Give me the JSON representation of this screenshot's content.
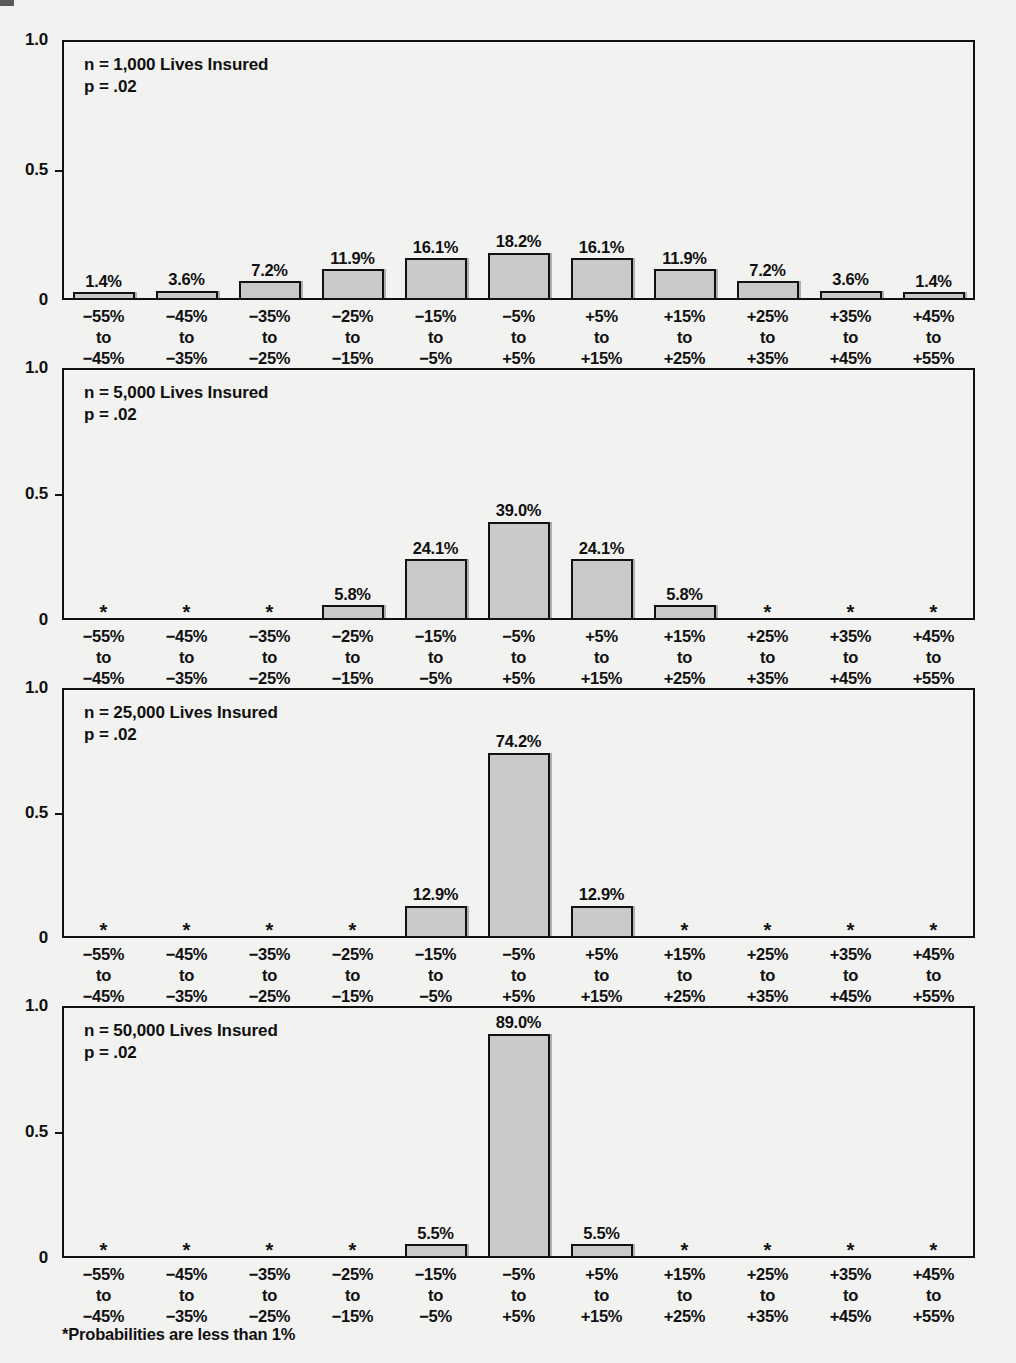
{
  "figure": {
    "footnote": "*Probabilities are less than 1%",
    "bar_fill_color": "#c9c9c9",
    "bar_stroke_color": "#111111",
    "background_color": "#f2f2f0"
  },
  "axis": {
    "y_ticks": [
      "1.0",
      "0.5",
      "0"
    ],
    "y_range": [
      0,
      1
    ],
    "x_categories": [
      "−55%\nto\n−45%",
      "−45%\nto\n−35%",
      "−35%\nto\n−25%",
      "−25%\nto\n−15%",
      "−15%\nto\n−5%",
      "−5%\nto\n+5%",
      "+5%\nto\n+15%",
      "+15%\nto\n+25%",
      "+25%\nto\n+35%",
      "+35%\nto\n+45%",
      "+45%\nto\n+55%"
    ],
    "less_than_one_marker": "*"
  },
  "chart_data": {
    "type": "bar",
    "title": "",
    "subtitle": "",
    "xlabel": "",
    "ylabel": "",
    "ylim": [
      0,
      1
    ],
    "grid": false,
    "legend": "none",
    "categories": [
      "-55% to -45%",
      "-45% to -35%",
      "-35% to -25%",
      "-25% to -15%",
      "-15% to -5%",
      "-5% to +5%",
      "+5% to +15%",
      "+15% to +25%",
      "+25% to +35%",
      "+35% to +45%",
      "+45% to +55%"
    ],
    "panels": [
      {
        "id": "panel-1000",
        "annotation_line1": "n = 1,000 Lives Insured",
        "annotation_line2": "p = .02",
        "n": 1000,
        "p": 0.02,
        "labels": [
          "1.4%",
          "3.6%",
          "7.2%",
          "11.9%",
          "16.1%",
          "18.2%",
          "16.1%",
          "11.9%",
          "7.2%",
          "3.6%",
          "1.4%"
        ],
        "values": [
          0.014,
          0.036,
          0.072,
          0.119,
          0.161,
          0.182,
          0.161,
          0.119,
          0.072,
          0.036,
          0.014
        ]
      },
      {
        "id": "panel-5000",
        "annotation_line1": "n = 5,000 Lives Insured",
        "annotation_line2": "p = .02",
        "n": 5000,
        "p": 0.02,
        "labels": [
          "*",
          "*",
          "*",
          "5.8%",
          "24.1%",
          "39.0%",
          "24.1%",
          "5.8%",
          "*",
          "*",
          "*"
        ],
        "values": [
          0,
          0,
          0,
          0.058,
          0.241,
          0.39,
          0.241,
          0.058,
          0,
          0,
          0
        ]
      },
      {
        "id": "panel-25000",
        "annotation_line1": "n = 25,000 Lives Insured",
        "annotation_line2": "p = .02",
        "n": 25000,
        "p": 0.02,
        "labels": [
          "*",
          "*",
          "*",
          "*",
          "12.9%",
          "74.2%",
          "12.9%",
          "*",
          "*",
          "*",
          "*"
        ],
        "values": [
          0,
          0,
          0,
          0,
          0.129,
          0.742,
          0.129,
          0,
          0,
          0,
          0
        ]
      },
      {
        "id": "panel-50000",
        "annotation_line1": "n = 50,000 Lives Insured",
        "annotation_line2": "p = .02",
        "n": 50000,
        "p": 0.02,
        "labels": [
          "*",
          "*",
          "*",
          "*",
          "5.5%",
          "89.0%",
          "5.5%",
          "*",
          "*",
          "*",
          "*"
        ],
        "values": [
          0,
          0,
          0,
          0,
          0.055,
          0.89,
          0.055,
          0,
          0,
          0,
          0
        ]
      }
    ]
  }
}
